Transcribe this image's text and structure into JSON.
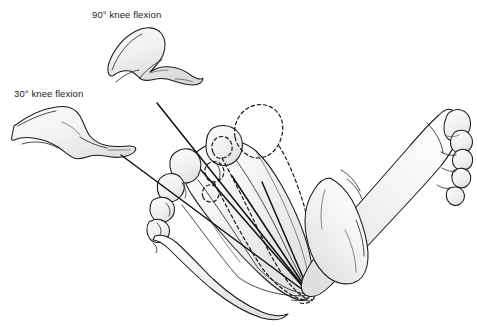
{
  "figure": {
    "background_color": "#ffffff",
    "width": 477,
    "height": 327,
    "line_color": "#1a1a1a",
    "fill_color": "#f1f1f1",
    "fill_shadow_color": "#d8d8d8",
    "text_color": "#1b1b1b"
  },
  "annotations": [
    {
      "id": "label-90",
      "text": "90° knee flexion",
      "x": 92,
      "y": 18,
      "angle_degrees": 90,
      "joint": "knee",
      "motion": "flexion"
    },
    {
      "id": "label-30",
      "text": "30° knee flexion",
      "x": 14,
      "y": 97,
      "angle_degrees": 30,
      "joint": "knee",
      "motion": "flexion"
    }
  ],
  "legs": [
    {
      "id": "leg-90",
      "label_ref": "label-90",
      "description": "Side view of leg with knee flexed to 90 degrees",
      "bounds": {
        "x": 104,
        "y": 26,
        "w": 100,
        "h": 58
      }
    },
    {
      "id": "leg-30",
      "label_ref": "label-30",
      "description": "Side view of leg with knee flexed to 30 degrees",
      "bounds": {
        "x": 12,
        "y": 104,
        "w": 123,
        "h": 58
      }
    }
  ],
  "feet": [
    {
      "id": "foot-left",
      "view": "plantar",
      "side": "left",
      "description": "Plantar view of foot with converging axis lines and dashed displaced outline",
      "bounds": {
        "x": 140,
        "y": 108,
        "w": 190,
        "h": 195
      },
      "has_axis_lines": true,
      "has_dashed_overlay": true,
      "toe_count": 5
    },
    {
      "id": "foot-right",
      "view": "plantar",
      "side": "right",
      "description": "Plantar view of foot with ankle and lower leg",
      "bounds": {
        "x": 330,
        "y": 100,
        "w": 145,
        "h": 200
      },
      "has_axis_lines": false,
      "has_dashed_overlay": false,
      "toe_count": 5
    }
  ],
  "axis_lines": [
    {
      "id": "axis-line-upper",
      "x1": 157,
      "y1": 103,
      "x2": 311,
      "y2": 296
    },
    {
      "id": "axis-line-lower",
      "x1": 121,
      "y1": 155,
      "x2": 311,
      "y2": 296
    },
    {
      "id": "axis-line-mid-a",
      "x1": 201,
      "y1": 170,
      "x2": 311,
      "y2": 296
    },
    {
      "id": "axis-line-mid-b",
      "x1": 232,
      "y1": 176,
      "x2": 311,
      "y2": 296
    },
    {
      "id": "axis-line-mid-c",
      "x1": 262,
      "y1": 180,
      "x2": 311,
      "y2": 296
    }
  ],
  "convergence_point": {
    "x": 311,
    "y": 296,
    "description": "Heel apex where all axis lines meet"
  }
}
